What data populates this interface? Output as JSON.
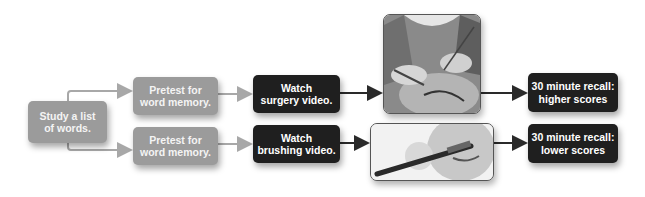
{
  "diagram": {
    "start": {
      "line1": "Study a list",
      "line2": "of words."
    },
    "top_branch": {
      "pretest": {
        "line1": "Pretest for",
        "line2": "word memory."
      },
      "watch": {
        "line1": "Watch",
        "line2": "surgery video."
      },
      "image": "surgery-photo",
      "result": {
        "line1": "30 minute recall:",
        "line2": "higher scores"
      }
    },
    "bottom_branch": {
      "pretest": {
        "line1": "Pretest for",
        "line2": "word memory."
      },
      "watch": {
        "line1": "Watch",
        "line2": "brushing video."
      },
      "image": "toothbrushing-photo",
      "result": {
        "line1": "30 minute recall:",
        "line2": "lower scores"
      }
    },
    "colors": {
      "gray_box": "#9b9b9b",
      "dark_box": "#1f1f1f",
      "gray_arrow": "#a8a8a8",
      "dark_arrow": "#2a2a2a"
    }
  }
}
